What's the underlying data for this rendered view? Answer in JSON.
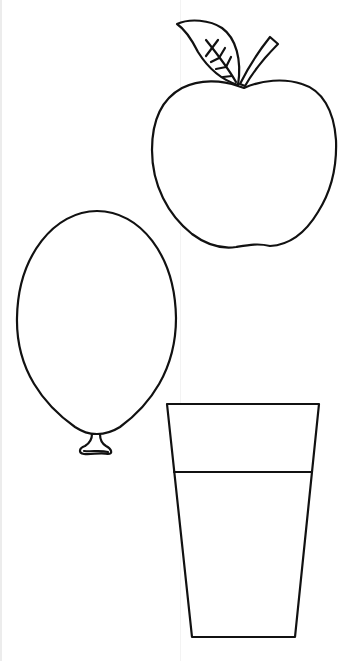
{
  "page": {
    "type": "coloring-sheet",
    "background": "#ffffff",
    "stroke_color": "#111111"
  },
  "shapes": [
    {
      "name": "apple",
      "parts": [
        "body",
        "leaf",
        "leaf-veins",
        "stem"
      ]
    },
    {
      "name": "balloon",
      "parts": [
        "body",
        "knot"
      ]
    },
    {
      "name": "glass",
      "parts": [
        "cup",
        "liquid-line"
      ]
    }
  ]
}
